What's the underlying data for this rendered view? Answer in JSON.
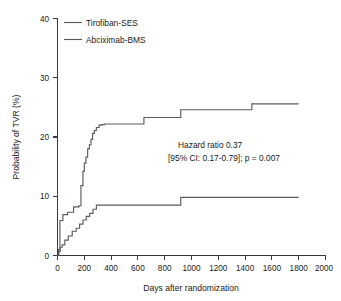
{
  "chart_data": {
    "type": "line",
    "title": "",
    "subtitle": "",
    "xlabel": "Days after randomization",
    "ylabel": "Probability of TVR (%)",
    "xlim": [
      0,
      2000
    ],
    "ylim": [
      0,
      40
    ],
    "xticks": [
      0,
      200,
      400,
      600,
      800,
      1000,
      1200,
      1400,
      1600,
      1800,
      2000
    ],
    "xtick_labels": [
      "0",
      "200",
      "400",
      "600",
      "800",
      "1000",
      "1200",
      "1400",
      "1600",
      "1800",
      "2000"
    ],
    "yticks": [
      0,
      10,
      20,
      30,
      40
    ],
    "ytick_labels": [
      "0",
      "10",
      "20",
      "30",
      "40"
    ],
    "grid": false,
    "step_style": "post",
    "legend_position": "top-left",
    "line_color": "#5b5b5b",
    "series": [
      {
        "name": "Tirofiban-SES",
        "x": [
          0,
          10,
          20,
          35,
          55,
          80,
          110,
          140,
          165,
          190,
          215,
          240,
          265,
          290,
          920,
          1800
        ],
        "values": [
          0,
          0.7,
          1.4,
          1.8,
          2.6,
          3.3,
          4.1,
          4.6,
          5.3,
          6.0,
          6.6,
          7.1,
          7.8,
          8.5,
          9.8,
          9.8
        ]
      },
      {
        "name": "Abciximab-BMS",
        "x": [
          0,
          8,
          18,
          40,
          75,
          120,
          160,
          175,
          190,
          200,
          212,
          225,
          238,
          250,
          262,
          275,
          290,
          310,
          330,
          350,
          645,
          920,
          1450,
          1800
        ],
        "values": [
          0,
          1.0,
          5.9,
          6.9,
          7.3,
          8.2,
          8.4,
          11.8,
          14.2,
          15.6,
          16.6,
          18.0,
          18.7,
          19.6,
          20.6,
          21.1,
          21.6,
          22.0,
          22.1,
          22.2,
          23.3,
          24.6,
          25.6,
          25.6
        ]
      }
    ],
    "annotations": [
      {
        "line1": "Hazard ratio 0.37",
        "line2": "[95% CI: 0.17-0.79]; p = 0.007"
      }
    ]
  },
  "axes": {
    "ylabel": "Probability of TVR (%)",
    "xlabel": "Days after randomization"
  },
  "legend": {
    "items": [
      {
        "label": "Tirofiban-SES"
      },
      {
        "label": "Abciximab-BMS"
      }
    ]
  },
  "annotation": {
    "hazard_ratio_line": "Hazard ratio 0.37",
    "ci_pvalue_line": "[95% CI: 0.17-0.79]; p = 0.007"
  }
}
